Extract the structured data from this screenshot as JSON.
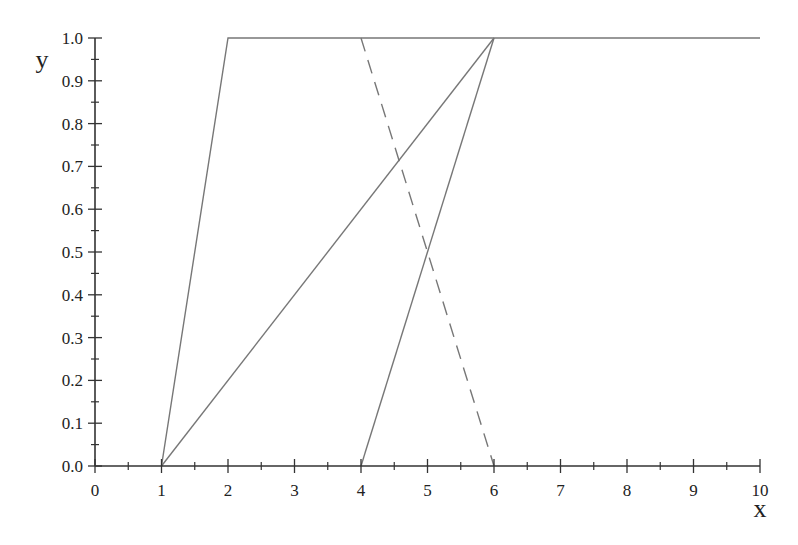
{
  "chart_data": {
    "type": "line",
    "title": "",
    "xlabel": "x",
    "ylabel": "y",
    "xlim": [
      0,
      10
    ],
    "ylim": [
      0,
      1.0
    ],
    "grid": false,
    "legend": null,
    "x_ticks": [
      "0",
      "1",
      "2",
      "3",
      "4",
      "5",
      "6",
      "7",
      "8",
      "9",
      "10"
    ],
    "x_minor_step": 0.5,
    "y_ticks": [
      "0.0",
      "0.1",
      "0.2",
      "0.3",
      "0.4",
      "0.5",
      "0.6",
      "0.7",
      "0.8",
      "0.9",
      "1.0"
    ],
    "y_minor_step": 0.05,
    "series": [
      {
        "name": "line-a",
        "style": "solid",
        "color": "#777777",
        "points": [
          [
            1,
            0
          ],
          [
            2,
            1
          ],
          [
            10,
            1
          ]
        ]
      },
      {
        "name": "line-b",
        "style": "solid",
        "color": "#777777",
        "points": [
          [
            1,
            0
          ],
          [
            6,
            1
          ]
        ]
      },
      {
        "name": "line-c",
        "style": "solid",
        "color": "#777777",
        "points": [
          [
            4,
            0
          ],
          [
            6,
            1
          ]
        ]
      },
      {
        "name": "line-d",
        "style": "dashed",
        "color": "#777777",
        "points": [
          [
            4,
            1
          ],
          [
            6,
            0
          ]
        ]
      }
    ]
  },
  "colors": {
    "axis": "#333333",
    "series": "#777777",
    "text": "#222222"
  }
}
